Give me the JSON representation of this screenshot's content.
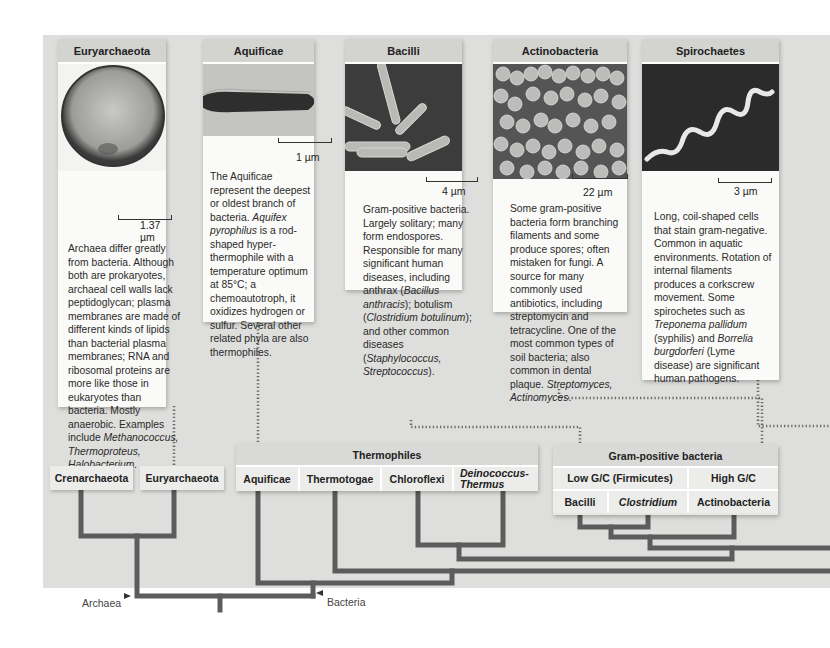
{
  "cards": [
    {
      "id": "euryarchaeota",
      "title": "Euryarchaeota",
      "scale": "1.37 µm",
      "text_parts": [
        {
          "t": "Archaea differ greatly from bacteria. Although both are prokaryotes, archaeal cell walls lack peptidoglycan; plasma membranes are made of different kinds of lipids than bacterial plasma membranes; RNA and ribosomal proteins are more like those in eukaryotes than bacteria. Mostly anaerobic. Examples include ",
          "i": false
        },
        {
          "t": "Methanococcus, Thermoproteus, Halobacterium.",
          "i": true
        }
      ]
    },
    {
      "id": "aquificae",
      "title": "Aquificae",
      "scale": "1 µm",
      "text_parts": [
        {
          "t": "The Aquificae represent the deepest or oldest branch of bacteria. ",
          "i": false
        },
        {
          "t": "Aquifex pyrophilus",
          "i": true
        },
        {
          "t": " is a rod-shaped hyper-thermophile with a temperature optimum at 85°C; a chemoautotroph, it oxidizes hydrogen or sulfur. Several other related phyla are also thermophiles.",
          "i": false
        }
      ]
    },
    {
      "id": "bacilli",
      "title": "Bacilli",
      "scale": "4 µm",
      "text_parts": [
        {
          "t": "Gram-positive bacteria. Largely solitary; many form endospores. Responsible for many significant human diseases, including anthrax (",
          "i": false
        },
        {
          "t": "Bacillus anthracis",
          "i": true
        },
        {
          "t": "); botulism (",
          "i": false
        },
        {
          "t": "Clostridium botulinum",
          "i": true
        },
        {
          "t": "); and other common diseases (",
          "i": false
        },
        {
          "t": "Staphylococcus, Streptococcus",
          "i": true
        },
        {
          "t": ").",
          "i": false
        }
      ]
    },
    {
      "id": "actinobacteria",
      "title": "Actinobacteria",
      "scale": "22 µm",
      "text_parts": [
        {
          "t": "Some gram-positive bacteria form branching filaments and some produce spores; often mistaken for fungi. A source for many commonly used antibiotics, including streptomycin and tetracycline. One of the most common types of soil bacteria; also common in dental plaque. ",
          "i": false
        },
        {
          "t": "Streptomyces, Actinomyces",
          "i": true
        },
        {
          "t": ".",
          "i": false
        }
      ]
    },
    {
      "id": "spirochaetes",
      "title": "Spirochaetes",
      "scale": "3 µm",
      "text_parts": [
        {
          "t": "Long, coil-shaped cells that stain gram-negative. Common in aquatic environments. Rotation of internal filaments produces a corkscrew movement. Some spirochetes such as ",
          "i": false
        },
        {
          "t": "Treponema pallidum",
          "i": true
        },
        {
          "t": " (syphilis) and ",
          "i": false
        },
        {
          "t": "Borrelia burgdorferi",
          "i": true
        },
        {
          "t": " (Lyme disease) are significant human pathogens.",
          "i": false
        }
      ]
    }
  ],
  "archaea_labels": {
    "crenarchaeota": "Crenarchaeota",
    "euryarchaeota": "Euryarchaeota"
  },
  "thermophiles": {
    "title": "Thermophiles",
    "members": [
      "Aquificae",
      "Thermotogae",
      "Chloroflexi",
      "Deinococcus-Thermus"
    ]
  },
  "gram_positive": {
    "title": "Gram-positive bacteria",
    "low_gc": "Low G/C (Firmicutes)",
    "high_gc": "High G/C",
    "members": [
      "Bacilli",
      "Clostridium",
      "Actinobacteria"
    ]
  },
  "domains": {
    "archaea": "Archaea",
    "bacteria": "Bacteria"
  },
  "colors": {
    "background_panel": "#dededc",
    "card": "#fafaf8",
    "header": "#d3d3d0",
    "tree_line": "#5c5c5c",
    "dotted_connector": "#6a6a6a"
  }
}
